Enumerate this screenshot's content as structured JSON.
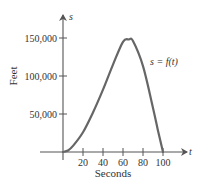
{
  "chart_data": {
    "type": "line",
    "title": "",
    "xlabel": "Seconds",
    "ylabel": "Feet",
    "x_axis_variable": "t",
    "y_axis_variable": "s",
    "curve_label": "s = f(t)",
    "xlim": [
      0,
      125
    ],
    "ylim": [
      0,
      180000
    ],
    "x_ticks": [
      20,
      40,
      60,
      80,
      100
    ],
    "x_tick_labels": [
      "20",
      "40",
      "60",
      "80",
      "100"
    ],
    "y_ticks": [
      50000,
      100000,
      150000
    ],
    "y_tick_labels": [
      "50,000",
      "100,000",
      "150,000"
    ],
    "grid": false,
    "legend": "none",
    "series": [
      {
        "name": "s = f(t)",
        "x": [
          0,
          5,
          10,
          20,
          30,
          40,
          50,
          60,
          66,
          70,
          80,
          90,
          95,
          100
        ],
        "values": [
          0,
          2000,
          8000,
          26000,
          52000,
          82000,
          115000,
          145000,
          148000,
          146000,
          113000,
          58000,
          28000,
          0
        ]
      }
    ],
    "color": "#555555"
  }
}
